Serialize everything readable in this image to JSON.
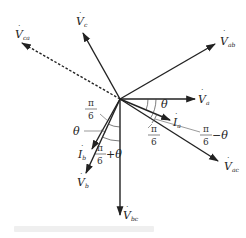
{
  "diagram": {
    "type": "phasor-diagram",
    "origin": [
      120,
      99
    ],
    "colors": {
      "line": "#222222",
      "caption": "#efefef"
    },
    "vectors": [
      {
        "id": "Vc",
        "label": "V",
        "sub": "c",
        "style": "solid",
        "end": [
          83,
          33
        ]
      },
      {
        "id": "Vca",
        "label": "V",
        "sub": "ca",
        "style": "dashed",
        "end": [
          22,
          43
        ]
      },
      {
        "id": "Vab",
        "label": "V",
        "sub": "ab",
        "style": "solid",
        "end": [
          215,
          44
        ]
      },
      {
        "id": "Va",
        "label": "V",
        "sub": "a",
        "style": "solid",
        "end": [
          195,
          99
        ]
      },
      {
        "id": "Ia",
        "label": "I",
        "sub": "a",
        "style": "solid",
        "end": [
          170,
          120
        ]
      },
      {
        "id": "Vac",
        "label": "V",
        "sub": "ac",
        "style": "solid",
        "end": [
          218,
          161
        ]
      },
      {
        "id": "Vbc",
        "label": "V",
        "sub": "bc",
        "style": "solid",
        "end": [
          120,
          215
        ]
      },
      {
        "id": "Vb",
        "label": "V",
        "sub": "b",
        "style": "solid",
        "end": [
          86,
          173
        ]
      },
      {
        "id": "Ib",
        "label": "I",
        "sub": "b",
        "style": "solid",
        "end": [
          92,
          149
        ]
      }
    ],
    "angle_labels": {
      "theta_a": "θ",
      "pi_over_6_a": {
        "num": "π",
        "den": "6"
      },
      "pi_over_6_minus_theta": {
        "num": "π",
        "den": "6",
        "suffix": "−θ"
      },
      "pi_over_6_b": {
        "num": "π",
        "den": "6"
      },
      "theta_b": "θ",
      "pi_over_6_plus_theta": {
        "num": "π",
        "den": "6",
        "suffix": "+θ"
      }
    },
    "dot_symbol": "·",
    "caption": ""
  }
}
